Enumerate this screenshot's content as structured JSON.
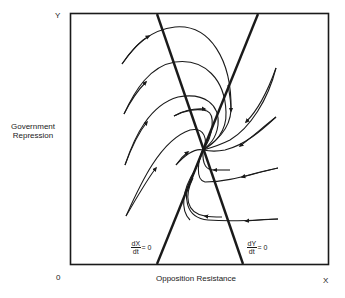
{
  "diagram": {
    "type": "phase-portrait",
    "axes": {
      "y_label": "Y",
      "x_label": "X",
      "origin_label": "0",
      "y_title_line1": "Government",
      "y_title_line2": "Repression",
      "x_title": "Opposition Resistance"
    },
    "nullclines": [
      {
        "id": "dXdt",
        "numerator": "dX",
        "denominator": "dt",
        "equals": "= 0",
        "description": "rising line from bottom-left to top-right"
      },
      {
        "id": "dYdt",
        "numerator": "dY",
        "denominator": "dt",
        "equals": "= 0",
        "description": "falling line from top-left to bottom-right"
      }
    ],
    "equilibrium": {
      "description": "stable spiral node at nullcline intersection"
    },
    "trajectory_count": 10,
    "colors": {
      "ink": "#1a1a1a",
      "background": "#ffffff"
    }
  }
}
